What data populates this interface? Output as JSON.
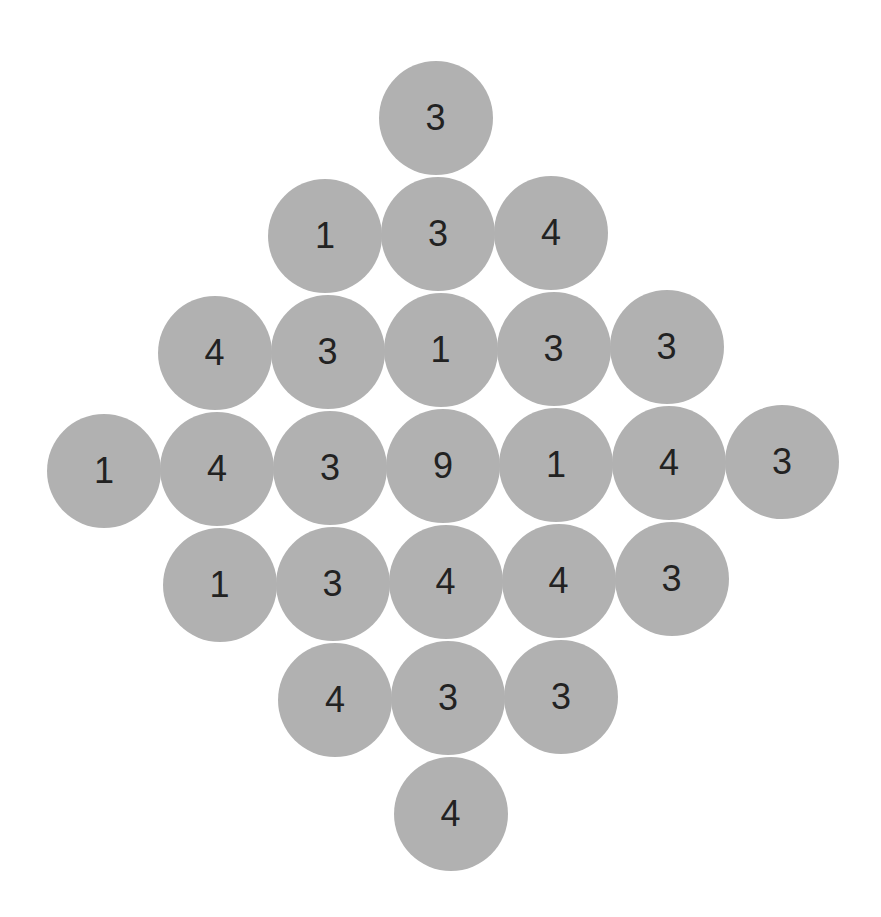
{
  "puzzle": {
    "layout": "diamond",
    "center": {
      "x": 443,
      "y": 466
    },
    "col_vector": {
      "x": 113,
      "y": -1.5
    },
    "row_vector": {
      "x": 2.5,
      "y": 116
    },
    "circle_color": "#b1b1b1",
    "text_color": "#222222",
    "rows": [
      {
        "row": -3,
        "cells": [
          {
            "col": 0,
            "value": "3"
          }
        ]
      },
      {
        "row": -2,
        "cells": [
          {
            "col": -1,
            "value": "1"
          },
          {
            "col": 0,
            "value": "3"
          },
          {
            "col": 1,
            "value": "4"
          }
        ]
      },
      {
        "row": -1,
        "cells": [
          {
            "col": -2,
            "value": "4"
          },
          {
            "col": -1,
            "value": "3"
          },
          {
            "col": 0,
            "value": "1"
          },
          {
            "col": 1,
            "value": "3"
          },
          {
            "col": 2,
            "value": "3"
          }
        ]
      },
      {
        "row": 0,
        "cells": [
          {
            "col": -3,
            "value": "1"
          },
          {
            "col": -2,
            "value": "4"
          },
          {
            "col": -1,
            "value": "3"
          },
          {
            "col": 0,
            "value": "9"
          },
          {
            "col": 1,
            "value": "1"
          },
          {
            "col": 2,
            "value": "4"
          },
          {
            "col": 3,
            "value": "3"
          }
        ]
      },
      {
        "row": 1,
        "cells": [
          {
            "col": -2,
            "value": "1"
          },
          {
            "col": -1,
            "value": "3"
          },
          {
            "col": 0,
            "value": "4"
          },
          {
            "col": 1,
            "value": "4"
          },
          {
            "col": 2,
            "value": "3"
          }
        ]
      },
      {
        "row": 2,
        "cells": [
          {
            "col": -1,
            "value": "4"
          },
          {
            "col": 0,
            "value": "3"
          },
          {
            "col": 1,
            "value": "3"
          }
        ]
      },
      {
        "row": 3,
        "cells": [
          {
            "col": 0,
            "value": "4"
          }
        ]
      }
    ]
  }
}
